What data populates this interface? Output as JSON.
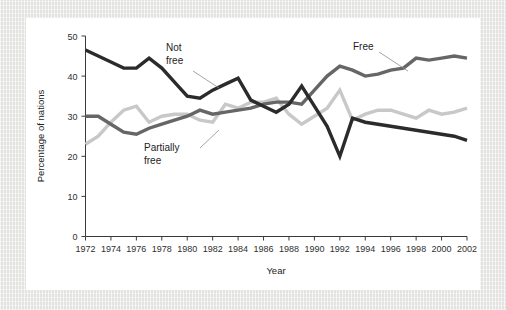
{
  "chart_data": {
    "type": "line",
    "title": "",
    "xlabel": "Year",
    "ylabel": "Percentage of nations",
    "xlim": [
      1972,
      2002
    ],
    "ylim": [
      0,
      50
    ],
    "grid": false,
    "legend_position": "inline-annotations",
    "x": [
      1972,
      1973,
      1974,
      1975,
      1976,
      1977,
      1978,
      1979,
      1980,
      1981,
      1982,
      1983,
      1984,
      1985,
      1986,
      1987,
      1988,
      1989,
      1990,
      1991,
      1992,
      1993,
      1994,
      1995,
      1996,
      1997,
      1998,
      1999,
      2000,
      2001,
      2002
    ],
    "xticks": [
      1972,
      1974,
      1976,
      1978,
      1980,
      1982,
      1984,
      1986,
      1988,
      1990,
      1992,
      1994,
      1996,
      1998,
      2000,
      2002
    ],
    "xtick_labels": [
      "1972",
      "1974",
      "1976",
      "1978",
      "1980",
      "1982",
      "1984",
      "1986",
      "1988",
      "1990",
      "1992",
      "1994",
      "1996",
      "1998",
      "2000",
      "2002"
    ],
    "yticks": [
      0,
      10,
      20,
      30,
      40,
      50
    ],
    "ytick_labels": [
      "0",
      "10",
      "20",
      "30",
      "40",
      "50"
    ],
    "series": [
      {
        "name": "Not free",
        "color": "#2b2b2b",
        "label_text_line1": "Not",
        "label_text_line2": "free",
        "values": [
          46.5,
          45.0,
          43.5,
          42.0,
          42.0,
          44.5,
          42.0,
          38.5,
          35.0,
          34.5,
          36.5,
          38.0,
          39.5,
          34.0,
          32.5,
          31.0,
          33.0,
          37.5,
          32.5,
          27.5,
          20.0,
          29.5,
          28.5,
          28.0,
          27.5,
          27.0,
          26.5,
          26.0,
          25.5,
          25.0,
          24.0
        ]
      },
      {
        "name": "Free",
        "color": "#666666",
        "label_text_line1": "Free",
        "label_text_line2": "",
        "values": [
          30.0,
          30.0,
          28.0,
          26.0,
          25.5,
          27.0,
          28.0,
          29.0,
          30.0,
          31.5,
          30.5,
          31.0,
          31.5,
          32.0,
          33.0,
          33.5,
          33.5,
          33.0,
          36.5,
          40.0,
          42.5,
          41.5,
          40.0,
          40.5,
          41.5,
          42.0,
          44.5,
          44.0,
          44.5,
          45.0,
          44.5
        ]
      },
      {
        "name": "Partially free",
        "color": "#c8c8c8",
        "label_text_line1": "Partially",
        "label_text_line2": "free",
        "values": [
          23.0,
          25.0,
          28.5,
          31.5,
          32.5,
          28.5,
          30.0,
          30.5,
          30.5,
          29.0,
          28.5,
          33.0,
          32.0,
          33.5,
          33.5,
          34.5,
          30.5,
          28.0,
          30.0,
          32.0,
          36.5,
          29.0,
          30.5,
          31.5,
          31.5,
          30.5,
          29.5,
          31.5,
          30.5,
          31.0,
          32.0
        ]
      }
    ]
  },
  "annotations": {
    "not_free": {
      "line1": "Not",
      "line2": "free"
    },
    "free": {
      "line1": "Free",
      "line2": ""
    },
    "partially_free": {
      "line1": "Partially",
      "line2": "free"
    }
  },
  "axes": {
    "x_title": "Year",
    "y_title": "Percentage of nations"
  }
}
